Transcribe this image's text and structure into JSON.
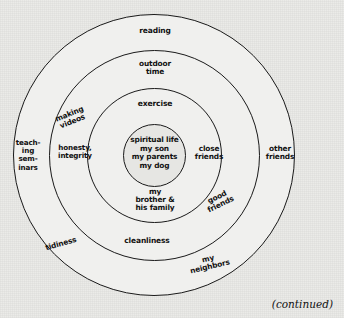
{
  "figure": {
    "type": "concentric-circles-diagram",
    "background_color": "#e9e9e6",
    "ring_fill_color": "#f0f0ee",
    "stroke_color": "#1a1a1a",
    "continued_note": "(continued)"
  },
  "rings": [
    {
      "index": 1,
      "name": "innermost-core",
      "labels": [
        {
          "id": "core",
          "text": "spiritual life\nmy son\nmy parents\nmy dog"
        }
      ]
    },
    {
      "index": 2,
      "name": "second-ring",
      "labels": [
        {
          "id": "honesty",
          "text": "honesty,\nintegrity"
        },
        {
          "id": "exercise",
          "text": "exercise"
        },
        {
          "id": "brother",
          "text": "my\nbrother &\nhis family"
        }
      ]
    },
    {
      "index": 3,
      "name": "third-ring",
      "labels": [
        {
          "id": "close-friends",
          "text": "close\nfriends"
        },
        {
          "id": "making-videos",
          "text": "making\nvideos"
        },
        {
          "id": "outdoor-time",
          "text": "outdoor\ntime"
        },
        {
          "id": "good-friends",
          "text": "good\nfriends"
        },
        {
          "id": "cleanliness",
          "text": "cleanliness"
        }
      ]
    },
    {
      "index": 4,
      "name": "outermost-ring",
      "labels": [
        {
          "id": "teaching-seminars",
          "text": "teach-\ning\nsem-\ninars"
        },
        {
          "id": "other-friends",
          "text": "other\nfriends"
        },
        {
          "id": "reading",
          "text": "reading"
        },
        {
          "id": "tidiness",
          "text": "tidiness"
        },
        {
          "id": "my-neighbors",
          "text": "my\nneighbors"
        }
      ]
    }
  ],
  "labels_flat": {
    "core": "spiritual life\nmy son\nmy parents\nmy dog",
    "honesty": "honesty,\nintegrity",
    "exercise": "exercise",
    "brother": "my\nbrother &\nhis family",
    "close_friends": "close\nfriends",
    "making_videos": "making\nvideos",
    "outdoor_time": "outdoor\ntime",
    "good_friends": "good\nfriends",
    "cleanliness": "cleanliness",
    "teaching_seminars": "teach-\ning\nsem-\ninars",
    "other_friends": "other\nfriends",
    "reading": "reading",
    "tidiness": "tidiness",
    "my_neighbors": "my\nneighbors",
    "continued": "(continued)"
  }
}
